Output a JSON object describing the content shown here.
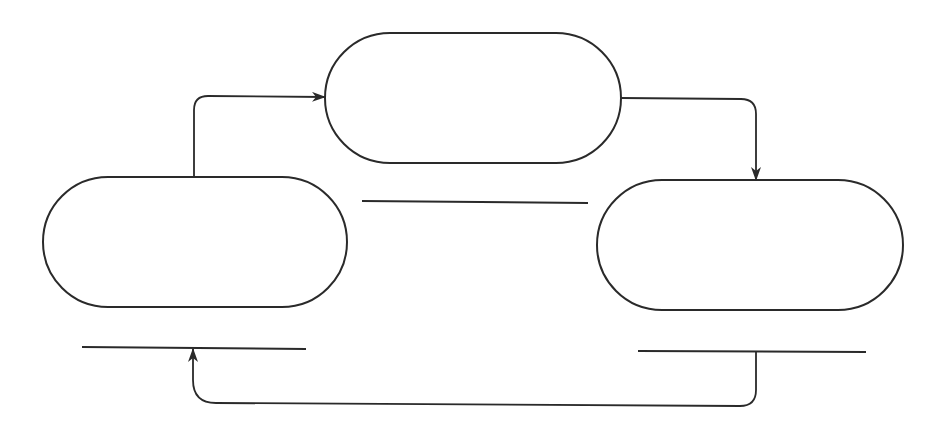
{
  "diagram": {
    "type": "cycle",
    "stroke_color": "#2a2a2a",
    "background_color": "#ffffff",
    "nodes": [
      {
        "id": "left",
        "label": ""
      },
      {
        "id": "top",
        "label": ""
      },
      {
        "id": "right",
        "label": ""
      }
    ],
    "underlines": [
      {
        "under": "left",
        "label": ""
      },
      {
        "under": "top",
        "label": ""
      },
      {
        "under": "right",
        "label": ""
      }
    ],
    "edges": [
      {
        "from": "left",
        "to": "top"
      },
      {
        "from": "top",
        "to": "right"
      },
      {
        "from": "right",
        "to": "left"
      }
    ]
  }
}
